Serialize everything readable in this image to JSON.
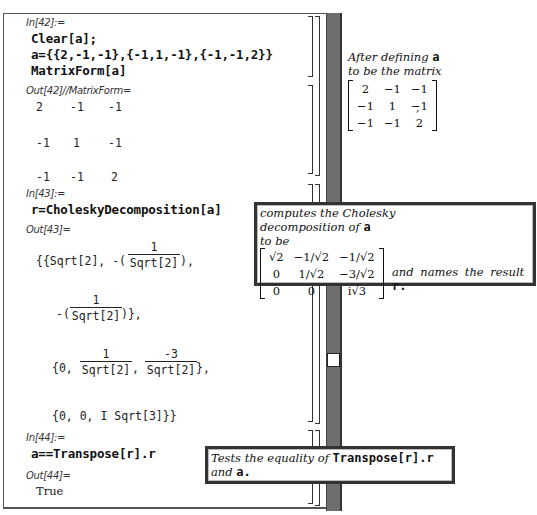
{
  "cells": [
    {
      "in_label": "In[42]:=",
      "input_lines": [
        "Clear[a];",
        "a={{2,-1,-1},{-1,1,-1},{-1,-1,2}}",
        "MatrixForm[a]"
      ],
      "out_label": "Out[42]//MatrixForm=",
      "output_matrix": [
        [
          "2",
          "-1",
          "-1"
        ],
        [
          "-1",
          "1",
          "-1"
        ],
        [
          "-1",
          "-1",
          "2"
        ]
      ]
    },
    {
      "in_label": "In[43]:=",
      "input_lines": [
        "r=CholeskyDecomposition[a]"
      ],
      "out_label": "Out[43]=",
      "output": {
        "line1_prefix": "{{Sqrt[2], -(",
        "line1_suffix": "),",
        "frac1_num": "1",
        "frac1_den": "Sqrt[2]",
        "line2_prefix": "-(",
        "line2_suffix": ")},",
        "frac2_num": "1",
        "frac2_den": "Sqrt[2]",
        "line3_prefix": "{0,",
        "frac3_num": "1",
        "frac3_den": "Sqrt[2]",
        "sep": ",",
        "frac4_num": "-3",
        "frac4_den": "Sqrt[2]",
        "line3_suffix": "},",
        "line4": "{0, 0, I Sqrt[3]}}"
      }
    },
    {
      "in_label": "In[44]:=",
      "input_lines": [
        "a==Transpose[r].r"
      ],
      "out_label": "Out[44]=",
      "output_text": "True"
    }
  ],
  "annotations": {
    "note1": {
      "line1_text": "After defining ",
      "line1_code": "a",
      "line2_text": "to be the matrix",
      "matrix": [
        [
          "2",
          "−1",
          "−1"
        ],
        [
          "−1",
          "1",
          "−1"
        ],
        [
          "−1",
          "−1",
          "2"
        ]
      ],
      "trailing": ","
    },
    "note2": {
      "line1": "computes the Cholesky",
      "line2_text": "decomposition of ",
      "line2_code": "a",
      "line3": "to be",
      "matrix": [
        [
          "√2",
          "−1/√2",
          "−1/√2"
        ],
        [
          "0",
          "1/√2",
          "−3/√2"
        ],
        [
          "0",
          "0",
          "i√3"
        ]
      ],
      "tail_text": "and names the result ",
      "tail_code": "r."
    },
    "note3": {
      "line1_text": "Tests the equality of ",
      "line1_code": "Transpose[r].r",
      "line2_text": "and ",
      "line2_code": "a."
    }
  },
  "scrollbar": {
    "thumb_position_pct": 68
  }
}
